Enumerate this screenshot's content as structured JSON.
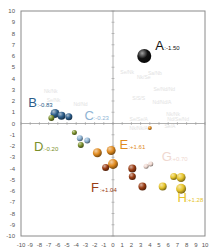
{
  "chart_data": {
    "type": "scatter",
    "title": "",
    "xlabel": "",
    "ylabel": "",
    "xlim": [
      -10,
      10
    ],
    "ylim": [
      -10,
      10
    ],
    "grid": false,
    "legend": "none",
    "x_ticks": [
      -10,
      -9,
      -8,
      -7,
      -6,
      -5,
      -4,
      -3,
      -2,
      -1,
      0,
      1,
      2,
      3,
      4,
      5,
      6,
      7,
      8,
      9,
      10
    ],
    "y_ticks": [
      10,
      9,
      8,
      7,
      6,
      5,
      4,
      3,
      2,
      1,
      0,
      -1,
      -2,
      -3,
      -4,
      -5,
      -6,
      -7,
      -8,
      -9,
      -10
    ],
    "groups": [
      {
        "letter": "A",
        "value": ":-1.50",
        "color": "#111111",
        "label_pos": [
          4.6,
          6.5
        ],
        "points": [
          {
            "x": 3.4,
            "y": 6.0,
            "r": 7
          }
        ]
      },
      {
        "letter": "B",
        "value": ":-0.83",
        "color": "#2c5d8a",
        "label_pos": [
          -9.2,
          1.5
        ],
        "points": [
          {
            "x": -6.3,
            "y": 0.9,
            "r": 4.5
          },
          {
            "x": -5.6,
            "y": 0.7,
            "r": 4
          },
          {
            "x": -4.8,
            "y": 0.6,
            "r": 3.5
          }
        ]
      },
      {
        "letter": "C",
        "value": ":-0.23",
        "color": "#8fb4d4",
        "label_pos": [
          -3.1,
          0.3
        ],
        "points": [
          {
            "x": -3.6,
            "y": -1.3,
            "r": 3
          },
          {
            "x": -2.8,
            "y": -1.5,
            "r": 3
          }
        ]
      },
      {
        "letter": "D",
        "value": ":-0.20",
        "color": "#7a8f2a",
        "label_pos": [
          -8.6,
          -2.4
        ],
        "points": [
          {
            "x": -6.7,
            "y": 0.5,
            "r": 3
          },
          {
            "x": -4.2,
            "y": -0.8,
            "r": 2.5
          },
          {
            "x": -3.5,
            "y": -1.9,
            "r": 3
          }
        ]
      },
      {
        "letter": "E",
        "value": ":+1.61",
        "color": "#e08a1e",
        "label_pos": [
          0.7,
          -2.3
        ],
        "points": [
          {
            "x": -1.7,
            "y": -2.6,
            "r": 4.5
          },
          {
            "x": -0.2,
            "y": -2.4,
            "r": 4.5
          },
          {
            "x": 0.0,
            "y": -3.6,
            "r": 5
          },
          {
            "x": 4.0,
            "y": -0.4,
            "r": 2
          }
        ]
      },
      {
        "letter": "F",
        "value": ":+1.04",
        "color": "#9a3d14",
        "label_pos": [
          -2.4,
          -6.1
        ],
        "points": [
          {
            "x": -0.8,
            "y": -3.9,
            "r": 3.5
          },
          {
            "x": 2.1,
            "y": -4.0,
            "r": 4
          },
          {
            "x": 2.1,
            "y": -4.7,
            "r": 3.5
          },
          {
            "x": 3.2,
            "y": -5.6,
            "r": 4
          }
        ]
      },
      {
        "letter": "G",
        "value": ":+0.70",
        "color": "#efd8d0",
        "label_pos": [
          5.3,
          -3.3
        ],
        "points": [
          {
            "x": 3.6,
            "y": -3.8,
            "r": 2.5
          },
          {
            "x": 4.1,
            "y": -3.6,
            "r": 2.5
          }
        ]
      },
      {
        "letter": "H",
        "value": ":+1.28",
        "color": "#e6c42a",
        "label_pos": [
          7.0,
          -7.0
        ],
        "points": [
          {
            "x": 5.4,
            "y": -5.6,
            "r": 4
          },
          {
            "x": 6.6,
            "y": -4.7,
            "r": 3.5
          },
          {
            "x": 7.4,
            "y": -4.8,
            "r": 4.5
          },
          {
            "x": 7.4,
            "y": -5.8,
            "r": 5
          }
        ]
      }
    ],
    "faint_labels": [
      {
        "text": "Se/Nk",
        "x": 0.8,
        "y": 4.4
      },
      {
        "text": "Sa/Nb",
        "x": 3.8,
        "y": 4.3
      },
      {
        "text": "Nk/Se",
        "x": 2.6,
        "y": 4.0
      },
      {
        "text": "Se/Nd/Nd",
        "x": 4.4,
        "y": 2.9
      },
      {
        "text": "S/S/S",
        "x": 2.1,
        "y": 2.1
      },
      {
        "text": "Nd/Nd/A",
        "x": 4.3,
        "y": 1.7
      },
      {
        "text": "Nk/Nk",
        "x": 5.8,
        "y": 0.7
      },
      {
        "text": "Se/Se/A",
        "x": 1.8,
        "y": 0.2
      },
      {
        "text": "Nd/Se/Nd",
        "x": 5.9,
        "y": 0.2
      },
      {
        "text": "Nk/Nk/A",
        "x": 1.8,
        "y": -0.6
      },
      {
        "text": "Se/A",
        "x": 5.6,
        "y": -0.4
      },
      {
        "text": "Nk/Nk",
        "x": -7.5,
        "y": 2.7
      },
      {
        "text": "Se/Nk",
        "x": -7.2,
        "y": 1.9
      },
      {
        "text": "Nd/Nd",
        "x": -4.3,
        "y": 1.6
      }
    ]
  },
  "axis": {
    "label_color": "#555555",
    "frame_color": "#777777"
  }
}
